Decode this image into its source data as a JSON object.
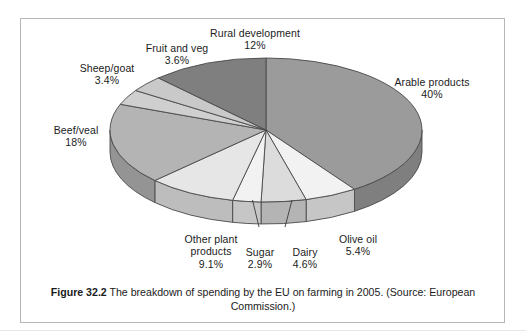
{
  "figure": {
    "caption_label": "Figure 32.2",
    "caption_text": " The breakdown of spending by the EU on farming in 2005. (Source: European Commission.)"
  },
  "chart_data": {
    "type": "pie",
    "title": "The breakdown of spending by the EU on farming in 2005",
    "source": "European Commission",
    "year": 2005,
    "unit": "%",
    "three_d": true,
    "start_angle_deg": 0,
    "direction": "clockwise",
    "legend": "none (direct labels)",
    "categories": [
      "Arable products",
      "Olive oil",
      "Dairy",
      "Sugar",
      "Other plant products",
      "Beef/veal",
      "Sheep/goat",
      "Fruit and veg",
      "Rural development"
    ],
    "values": [
      40,
      5.4,
      4.6,
      2.9,
      9.1,
      18,
      3.4,
      3.6,
      12
    ],
    "slices": [
      {
        "label": "Arable products",
        "value": 40,
        "value_text": "40%",
        "color": "#9b9b9b"
      },
      {
        "label": "Olive oil",
        "value": 5.4,
        "value_text": "5.4%",
        "color": "#f2f2f2"
      },
      {
        "label": "Dairy",
        "value": 4.6,
        "value_text": "4.6%",
        "color": "#dcdcdc"
      },
      {
        "label": "Sugar",
        "value": 2.9,
        "value_text": "2.9%",
        "color": "#f2f2f2"
      },
      {
        "label": "Other plant products",
        "value": 9.1,
        "value_text": "9.1%",
        "color": "#e6e6e6"
      },
      {
        "label": "Beef/veal",
        "value": 18,
        "value_text": "18%",
        "color": "#b4b4b4"
      },
      {
        "label": "Sheep/goat",
        "value": 3.4,
        "value_text": "3.4%",
        "color": "#cfcfcf"
      },
      {
        "label": "Fruit and veg",
        "value": 3.6,
        "value_text": "3.6%",
        "color": "#c9c9c9"
      },
      {
        "label": "Rural development",
        "value": 12,
        "value_text": "12%",
        "color": "#7f7f7f"
      }
    ]
  },
  "labels": {
    "rural_development": {
      "name": "Rural development",
      "value": "12%"
    },
    "fruit_and_veg": {
      "name": "Fruit and veg",
      "value": "3.6%"
    },
    "sheep_goat": {
      "name": "Sheep/goat",
      "value": "3.4%"
    },
    "beef_veal": {
      "name": "Beef/veal",
      "value": "18%"
    },
    "arable_products": {
      "name": "Arable products",
      "value": "40%"
    },
    "other_plant_1": {
      "name": "Other plant"
    },
    "other_plant_2": {
      "name": "products",
      "value": "9.1%"
    },
    "sugar": {
      "name": "Sugar",
      "value": "2.9%"
    },
    "dairy": {
      "name": "Dairy",
      "value": "4.6%"
    },
    "olive_oil": {
      "name": "Olive oil",
      "value": "5.4%"
    }
  },
  "colors": {
    "frame_border": "#b7b7b7",
    "outline": "#4a4a4a",
    "background": "#ffffff",
    "text": "#1b1b1b"
  }
}
